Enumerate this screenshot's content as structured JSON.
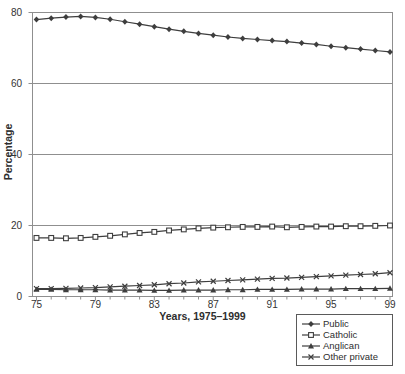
{
  "chart_data": {
    "type": "line",
    "title": "",
    "xlabel": "Years, 1975–1999",
    "ylabel": "Percentage",
    "xlim": [
      1974.73,
      1999.17
    ],
    "ylim": [
      0,
      80
    ],
    "grid": "horizontal",
    "legend_position": "bottom-right-outside",
    "x": [
      1975,
      1976,
      1977,
      1978,
      1979,
      1980,
      1981,
      1982,
      1983,
      1984,
      1985,
      1986,
      1987,
      1988,
      1989,
      1990,
      1991,
      1992,
      1993,
      1994,
      1995,
      1996,
      1997,
      1998,
      1999
    ],
    "x_ticks": [
      1975,
      1979,
      1983,
      1987,
      1991,
      1995,
      1999
    ],
    "x_tick_labels": [
      "75",
      "79",
      "83",
      "87",
      "91",
      "95",
      "99"
    ],
    "y_ticks": [
      0,
      20,
      40,
      60,
      80
    ],
    "y_tick_labels": [
      "0",
      "20",
      "40",
      "60",
      "80"
    ],
    "series": [
      {
        "name": "Public",
        "marker": "diamond",
        "values": [
          78.0,
          78.4,
          78.7,
          78.9,
          78.6,
          78.1,
          77.4,
          76.7,
          76.0,
          75.3,
          74.7,
          74.1,
          73.6,
          73.1,
          72.7,
          72.4,
          72.1,
          71.8,
          71.4,
          71.0,
          70.5,
          70.1,
          69.7,
          69.3,
          68.9
        ]
      },
      {
        "name": "Catholic",
        "marker": "square-open",
        "values": [
          16.5,
          16.5,
          16.4,
          16.5,
          16.8,
          17.1,
          17.5,
          17.9,
          18.2,
          18.6,
          18.9,
          19.2,
          19.4,
          19.5,
          19.6,
          19.6,
          19.7,
          19.5,
          19.6,
          19.7,
          19.7,
          19.8,
          19.8,
          19.9,
          20.0
        ]
      },
      {
        "name": "Anglican",
        "marker": "triangle",
        "values": [
          2.0,
          2.0,
          1.9,
          1.9,
          1.9,
          1.8,
          1.8,
          1.8,
          1.7,
          1.7,
          1.8,
          1.8,
          1.8,
          1.9,
          1.9,
          2.0,
          2.0,
          2.0,
          2.1,
          2.1,
          2.1,
          2.2,
          2.2,
          2.2,
          2.3
        ]
      },
      {
        "name": "Other private",
        "marker": "x",
        "values": [
          2.2,
          2.2,
          2.3,
          2.4,
          2.5,
          2.7,
          2.9,
          3.1,
          3.3,
          3.6,
          3.8,
          4.1,
          4.3,
          4.5,
          4.7,
          4.9,
          5.1,
          5.2,
          5.4,
          5.6,
          5.8,
          6.0,
          6.2,
          6.4,
          6.7
        ]
      }
    ],
    "colors": {
      "series_line": "#3e3e3e",
      "grid": "#8f8f8f",
      "border": "#8f8f8f",
      "text": "#2e2e2e",
      "background": "#ffffff"
    }
  }
}
